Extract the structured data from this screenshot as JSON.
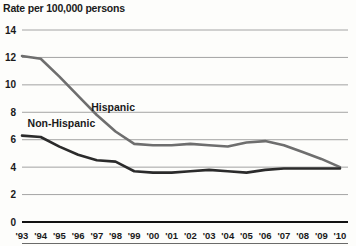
{
  "chart_data": {
    "type": "line",
    "title": "Rate per 100,000 persons",
    "xlabel": "",
    "ylabel": "Rate per 100,000 persons",
    "grid": true,
    "legend_position": "inline-annotation",
    "ylim": [
      0,
      14
    ],
    "yticks": [
      0,
      2,
      4,
      6,
      8,
      10,
      12,
      14
    ],
    "ytick_labels": [
      "0",
      "2",
      "4",
      "6",
      "8",
      "10",
      "12",
      "14"
    ],
    "categories": [
      "'93",
      "'94",
      "'95",
      "'96",
      "'97",
      "'98",
      "'99",
      "'00",
      "'01",
      "'02",
      "'03",
      "'04",
      "'05",
      "'06",
      "'07",
      "'08",
      "'09",
      "'10"
    ],
    "x": [
      1993,
      1994,
      1995,
      1996,
      1997,
      1998,
      1999,
      2000,
      2001,
      2002,
      2003,
      2004,
      2005,
      2006,
      2007,
      2008,
      2009,
      2010
    ],
    "series": [
      {
        "name": "Hispanic",
        "color": "#6e6e6e",
        "values": [
          12.1,
          11.9,
          10.6,
          9.2,
          7.8,
          6.6,
          5.7,
          5.6,
          5.6,
          5.7,
          5.6,
          5.5,
          5.8,
          5.9,
          5.6,
          5.1,
          4.6,
          4.0
        ]
      },
      {
        "name": "Non-Hispanic",
        "color": "#2b2b2b",
        "values": [
          6.3,
          6.2,
          5.5,
          4.9,
          4.5,
          4.4,
          3.7,
          3.6,
          3.6,
          3.7,
          3.8,
          3.7,
          3.6,
          3.8,
          3.9,
          3.9,
          3.9,
          3.9
        ]
      }
    ],
    "annotations": [
      {
        "text": "Hispanic",
        "x": 1996.7,
        "y": 8.1
      },
      {
        "text": "Non-Hispanic",
        "x": 1993.3,
        "y": 6.9
      }
    ]
  }
}
